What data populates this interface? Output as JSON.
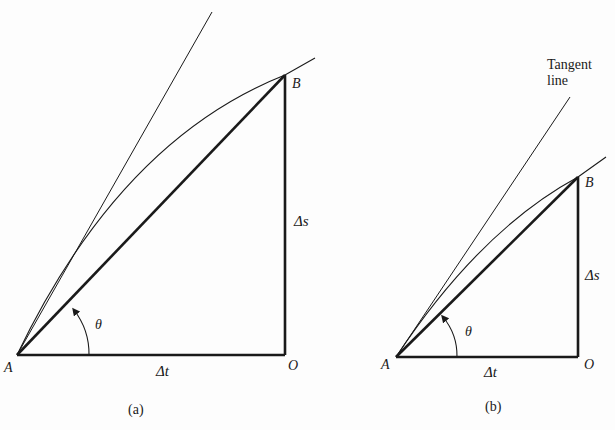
{
  "figure_a": {
    "caption": "(a)",
    "points": {
      "A": {
        "label": "A",
        "x": 17,
        "y": 355
      },
      "O": {
        "label": "O",
        "x": 285,
        "y": 355
      },
      "B": {
        "label": "B",
        "x": 285,
        "y": 75
      }
    },
    "labels": {
      "delta_s": "Δs",
      "delta_t": "Δt",
      "theta": "θ"
    },
    "tangent_end": {
      "x": 212,
      "y": 12
    },
    "curve_end": {
      "x": 315,
      "y": 58
    }
  },
  "figure_b": {
    "caption": "(b)",
    "points": {
      "A": {
        "label": "A",
        "x": 396,
        "y": 357
      },
      "O": {
        "label": "O",
        "x": 578,
        "y": 357
      },
      "B": {
        "label": "B",
        "x": 578,
        "y": 177
      }
    },
    "labels": {
      "delta_s": "Δs",
      "delta_t": "Δt",
      "theta": "θ",
      "tangent_line_1": "Tangent",
      "tangent_line_2": "line"
    },
    "tangent_end": {
      "x": 570,
      "y": 97
    },
    "curve_end": {
      "x": 606,
      "y": 157
    }
  },
  "colors": {
    "ink": "#1a1a1a",
    "paper": "#fdfdfd"
  }
}
